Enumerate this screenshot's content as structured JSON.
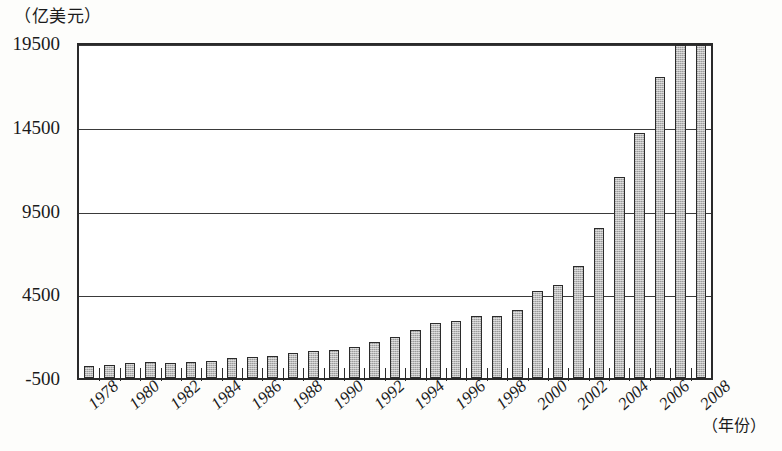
{
  "chart_data": {
    "type": "bar",
    "title": "（亿美元）",
    "unit_label": "（亿美元）",
    "xlabel": "（年份）",
    "ylabel": "",
    "ylim": [
      -500,
      19500
    ],
    "grid": true,
    "grid_axis": "y",
    "legend": null,
    "yticks": [
      19500,
      14500,
      9500,
      4500,
      -500
    ],
    "ytick_labels": [
      "19500",
      "14500",
      "9500",
      "4500",
      "-500"
    ],
    "xtick_labels": [
      "1978",
      "1980",
      "1982",
      "1984",
      "1986",
      "1988",
      "1990",
      "1992",
      "1994",
      "1996",
      "1998",
      "2000",
      "2002",
      "2004",
      "2006",
      "2008"
    ],
    "categories": [
      1978,
      1979,
      1980,
      1981,
      1982,
      1983,
      1984,
      1985,
      1986,
      1987,
      1988,
      1989,
      1990,
      1991,
      1992,
      1993,
      1994,
      1995,
      1996,
      1997,
      1998,
      1999,
      2000,
      2001,
      2002,
      2003,
      2004,
      2005,
      2006,
      2007,
      2008
    ],
    "values": [
      206,
      293,
      381,
      440,
      416,
      436,
      535,
      696,
      738,
      827,
      1028,
      1117,
      1154,
      1357,
      1656,
      1957,
      2366,
      2808,
      2899,
      3252,
      3240,
      3607,
      4743,
      5098,
      6208,
      8510,
      11546,
      14221,
      17604,
      21738,
      25616
    ],
    "values_scaled_note": "bar heights read against axis in 亿美元",
    "series": [
      {
        "name": "进出口总额",
        "values": [
          206,
          293,
          381,
          440,
          416,
          436,
          535,
          696,
          738,
          827,
          1028,
          1117,
          1154,
          1357,
          1656,
          1957,
          2366,
          2808,
          2899,
          3252,
          3240,
          3607,
          4743,
          5098,
          6208,
          8510,
          11546,
          14221,
          17604,
          21738,
          25616
        ]
      }
    ],
    "bar_color": "#b9b9b9",
    "bar_edge_color": "#2b2b2b",
    "axis_color": "#2a2a2a",
    "plot_background": "#ffffff"
  },
  "plot_values_px": {
    "note": "heights expressed as fraction of (-500..19500) span, used for rendering",
    "fractions": [
      0.035,
      0.04,
      0.044,
      0.047,
      0.046,
      0.047,
      0.052,
      0.06,
      0.062,
      0.066,
      0.077,
      0.081,
      0.083,
      0.093,
      0.108,
      0.123,
      0.143,
      0.165,
      0.17,
      0.188,
      0.187,
      0.205,
      0.262,
      0.28,
      0.335,
      0.45,
      0.602,
      0.736,
      0.905,
      1.0,
      1.0
    ]
  }
}
